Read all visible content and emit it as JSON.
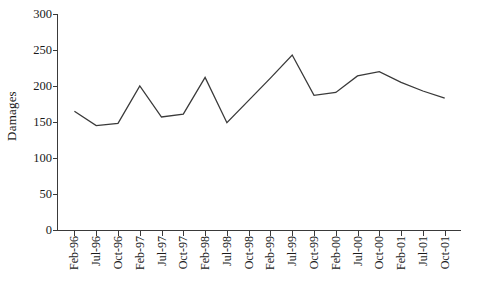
{
  "chart_data": {
    "type": "line",
    "title": "",
    "xlabel": "",
    "ylabel": "Damages",
    "ylim": [
      0,
      300
    ],
    "yticks": [
      0,
      50,
      100,
      150,
      200,
      250,
      300
    ],
    "grid": false,
    "legend": null,
    "line_color": "#3a3a3a",
    "categories": [
      "Feb-96",
      "Jul-96",
      "Oct-96",
      "Feb-97",
      "Jul-97",
      "Oct-97",
      "Feb-98",
      "Jul-98",
      "Oct-98",
      "Feb-99",
      "Jul-99",
      "Oct-99",
      "Feb-00",
      "Jul-00",
      "Oct-00",
      "Feb-01",
      "Jul-01",
      "Oct-01"
    ],
    "values": [
      165,
      145,
      148,
      200,
      157,
      161,
      212,
      149,
      180,
      211,
      243,
      187,
      191,
      214,
      220,
      205,
      193,
      183
    ]
  }
}
